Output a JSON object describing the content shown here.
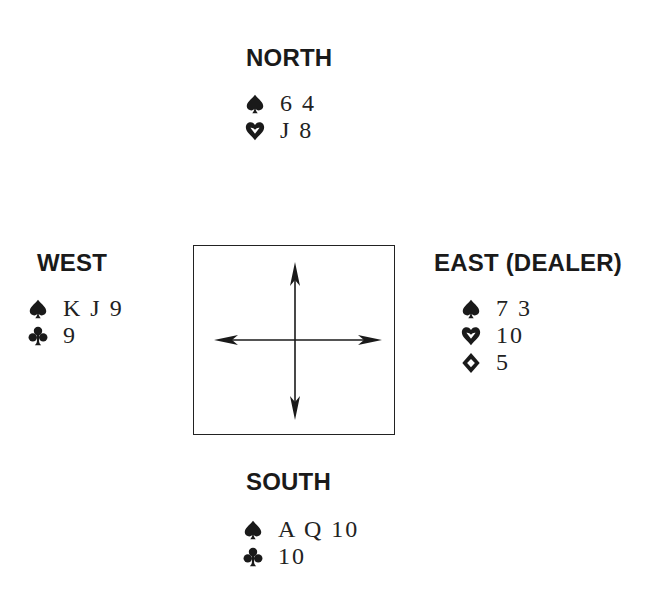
{
  "north": {
    "seat": "NORTH",
    "holdings": [
      {
        "suit": "spades",
        "cards": "6 4"
      },
      {
        "suit": "hearts",
        "cards": "J 8"
      }
    ]
  },
  "west": {
    "seat": "WEST",
    "holdings": [
      {
        "suit": "spades",
        "cards": "K J 9"
      },
      {
        "suit": "clubs",
        "cards": "9"
      }
    ]
  },
  "east": {
    "seat": "EAST (DEALER)",
    "holdings": [
      {
        "suit": "spades",
        "cards": "7 3"
      },
      {
        "suit": "hearts",
        "cards": "10"
      },
      {
        "suit": "diamonds",
        "cards": "5"
      }
    ]
  },
  "south": {
    "seat": "SOUTH",
    "holdings": [
      {
        "suit": "spades",
        "cards": "A Q 10"
      },
      {
        "suit": "clubs",
        "cards": "10"
      }
    ]
  },
  "compass": {
    "directions": [
      "north",
      "south",
      "east",
      "west"
    ]
  },
  "colors": {
    "ink": "#1a1a1a",
    "background": "#ffffff"
  }
}
